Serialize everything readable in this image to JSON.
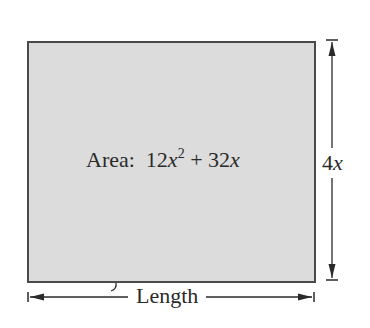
{
  "figure": {
    "shape": "rectangle",
    "fill_color": "#dcdcdc",
    "stroke_color": "#4a4a4a",
    "area_label": {
      "prefix": "Area:",
      "coef1": "12",
      "var1": "x",
      "exp1": "2",
      "op": "+",
      "coef2": "32",
      "var2": "x"
    },
    "height_label": {
      "coef": "4",
      "var": "x"
    },
    "width_label": "Length"
  }
}
